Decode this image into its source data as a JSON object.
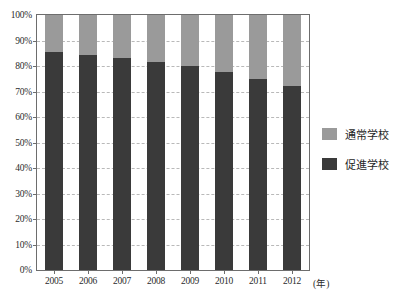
{
  "chart_data": {
    "type": "bar",
    "stacked": true,
    "stacked_percent": true,
    "title": "",
    "subtitle": "",
    "xlabel": "(年)",
    "ylabel": "",
    "categories": [
      "2005",
      "2006",
      "2007",
      "2008",
      "2009",
      "2010",
      "2011",
      "2012"
    ],
    "series": [
      {
        "name": "促進学校",
        "color": "#3a3a3a",
        "values": [
          85.5,
          84.5,
          83.0,
          81.5,
          80.0,
          77.5,
          75.0,
          72.0
        ]
      },
      {
        "name": "通常学校",
        "color": "#9a9a9a",
        "values": [
          14.5,
          15.5,
          17.0,
          18.5,
          20.0,
          22.5,
          25.0,
          28.0
        ]
      }
    ],
    "ylim": [
      0,
      100
    ],
    "ytick_values": [
      0,
      10,
      20,
      30,
      40,
      50,
      60,
      70,
      80,
      90,
      100
    ],
    "ytick_labels": [
      "0%",
      "10%",
      "20%",
      "30%",
      "40%",
      "50%",
      "60%",
      "70%",
      "80%",
      "90%",
      "100%"
    ],
    "grid": true,
    "grid_axis": "y",
    "grid_style": "dashed",
    "legend_position": "right",
    "legend_entries": [
      {
        "label": "通常学校",
        "color": "#9a9a9a"
      },
      {
        "label": "促進学校",
        "color": "#3a3a3a"
      }
    ],
    "axis_color": "#6d6d6d",
    "grid_color": "#b9b9b9",
    "background_color": "#ffffff"
  }
}
